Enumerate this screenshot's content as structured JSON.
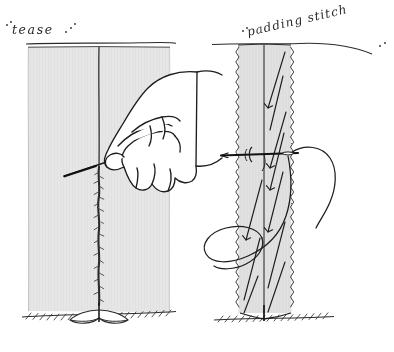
{
  "figure": {
    "style": "pen-and-ink line drawing, hand lettering",
    "background_color": "#ffffff",
    "ink_color": "#1a1a1a",
    "fabric_fill": "#e4e4e4",
    "fabric_fill_light": "#ededed",
    "panels": [
      {
        "id": "left-panel",
        "label": "tease",
        "label_decoration": "dots before and after the word",
        "label_underline": true,
        "description": "Wide fabric panel seen edge-on with a centre seam line; a hand holds a needle that teases the seam open below the point of entry",
        "fabric": {
          "x": 28,
          "y": 47,
          "width": 142,
          "height": 268
        },
        "centre_line_x": 99,
        "teased_from_y": 168,
        "ground_line": true,
        "has_hand": true,
        "has_needle": true
      },
      {
        "id": "right-panel",
        "label": "padding stitch",
        "label_decoration": "dots before and after the phrase",
        "label_underline": true,
        "label_rotation_deg": -13,
        "description": "Narrow fabric strip with hatched raw edges, rows of slanted padding stitches, a needle passing horizontally through it and a long loop of thread",
        "fabric": {
          "x": 237,
          "y": 44,
          "width": 55,
          "height": 272
        },
        "centre_line_x": 264,
        "hatched_edges": true,
        "stitch_count": 6,
        "needle_y": 154,
        "ground_line": true,
        "has_needle": true,
        "has_thread_loop": true
      }
    ],
    "elements": {
      "hand_name": "hand-holding-needle",
      "needle_left_name": "needle-teasing",
      "needle_right_name": "needle-horizontal",
      "thread_name": "thread-loop",
      "ground_name": "ground-hatching"
    }
  }
}
